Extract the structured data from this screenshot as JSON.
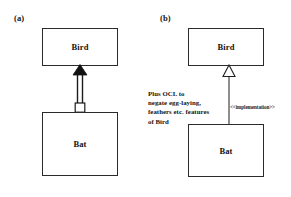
{
  "diagram": {
    "kind": "uml-class-diagram",
    "background_color": "#ffffff",
    "line_color": "#2b2b2b",
    "text_color": "#141414",
    "panels": [
      {
        "id": "a",
        "label": "(a)",
        "classes": [
          {
            "name": "Bird",
            "role": "supertype"
          },
          {
            "name": "Bat",
            "role": "subtype"
          }
        ],
        "relationship": {
          "type": "filled-arrow-with-square-tail",
          "arrowhead": "solid-filled-triangle",
          "tail": "hollow-square",
          "direction": "bat-to-bird",
          "stereotype": ""
        }
      },
      {
        "id": "b",
        "label": "(b)",
        "classes": [
          {
            "name": "Bird",
            "role": "supertype"
          },
          {
            "name": "Bat",
            "role": "subtype"
          }
        ],
        "relationship": {
          "type": "generalization",
          "arrowhead": "hollow-triangle",
          "tail": "plain-line",
          "direction": "bat-to-bird",
          "stereotype": "<<implementation>>"
        },
        "note": {
          "lines": [
            "Plus OCL to",
            "negate egg-laying,",
            "feathers etc. features",
            "of Bird"
          ]
        }
      }
    ]
  }
}
